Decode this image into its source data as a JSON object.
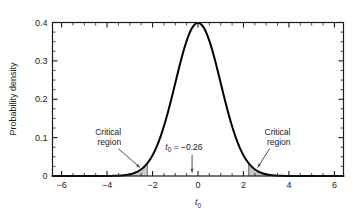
{
  "chart_data": {
    "type": "line",
    "title": "",
    "subtitle": "",
    "xlabel": "t0",
    "xlabel_display": "t",
    "xlabel_sub": "0",
    "ylabel": "Probability density",
    "xlim": [
      -6.4,
      6.4
    ],
    "ylim": [
      0,
      0.4
    ],
    "x_ticks": [
      -6,
      -4,
      -2,
      0,
      2,
      4,
      6
    ],
    "x_tick_labels": [
      "−6",
      "−4",
      "−2",
      "0",
      "2",
      "4",
      "6"
    ],
    "x_minor_step": 0.5,
    "y_ticks": [
      0,
      0.1,
      0.2,
      0.3,
      0.4
    ],
    "y_tick_labels": [
      "0",
      "0.1",
      "0.2",
      "0.3",
      "0.4"
    ],
    "y_minor_step": 0.025,
    "grid": false,
    "legend": "none",
    "curve_name": "t-distribution probability density",
    "peak_value": 0.399,
    "peak_x": 0,
    "distribution": "standard normal / t density",
    "series": [
      {
        "name": "probability density",
        "x": [
          -6.4,
          -6.0,
          -5.5,
          -5.0,
          -4.5,
          -4.0,
          -3.5,
          -3.0,
          -2.5,
          -2.23,
          -2.0,
          -1.75,
          -1.5,
          -1.25,
          -1.0,
          -0.75,
          -0.5,
          -0.26,
          0.0,
          0.26,
          0.5,
          0.75,
          1.0,
          1.25,
          1.5,
          1.75,
          2.0,
          2.23,
          2.5,
          3.0,
          3.5,
          4.0,
          4.5,
          5.0,
          5.5,
          6.0,
          6.4
        ],
        "values": [
          0.0,
          0.0,
          0.0,
          0.0,
          0.0,
          0.0,
          0.001,
          0.004,
          0.018,
          0.033,
          0.054,
          0.086,
          0.13,
          0.183,
          0.242,
          0.301,
          0.352,
          0.385,
          0.399,
          0.385,
          0.352,
          0.301,
          0.242,
          0.183,
          0.13,
          0.086,
          0.054,
          0.033,
          0.018,
          0.004,
          0.001,
          0.0,
          0.0,
          0.0,
          0.0,
          0.0,
          0.0
        ]
      }
    ],
    "shaded_regions": [
      {
        "name": "left critical region",
        "from": -6.4,
        "to": -2.23,
        "boundary_x": -2.23,
        "fill": "#c9c9c9"
      },
      {
        "name": "right critical region",
        "from": 2.23,
        "to": 6.4,
        "boundary_x": 2.23,
        "fill": "#c9c9c9"
      }
    ],
    "annotations": [
      {
        "name": "critical-region-left",
        "line1": "Critical",
        "line2": "region",
        "text_x": -3.9,
        "text_y": 0.108,
        "arrow_to_x": -2.55,
        "arrow_to_y": 0.022
      },
      {
        "name": "critical-region-right",
        "line1": "Critical",
        "line2": "region",
        "text_x": 3.55,
        "text_y": 0.108,
        "arrow_to_x": 2.62,
        "arrow_to_y": 0.022
      },
      {
        "name": "t0-observed",
        "display": "t",
        "sub": "0",
        "rest": " = −0.26",
        "value": -0.26,
        "text_x": -0.62,
        "text_y": 0.068,
        "arrow_to_x": -0.26,
        "arrow_to_y": 0.006
      }
    ],
    "colors": {
      "curve": "#000000",
      "axis": "#1a1a1a",
      "shade_fill": "#c9c9c9",
      "shade_stroke": "#8c8c8c",
      "background": "#ffffff",
      "annotation_arrow": "#4d4d4d"
    }
  },
  "figure": {
    "x_axis_label_display": "t",
    "x_axis_label_sub": "0",
    "y_axis_label": "Probability density"
  }
}
